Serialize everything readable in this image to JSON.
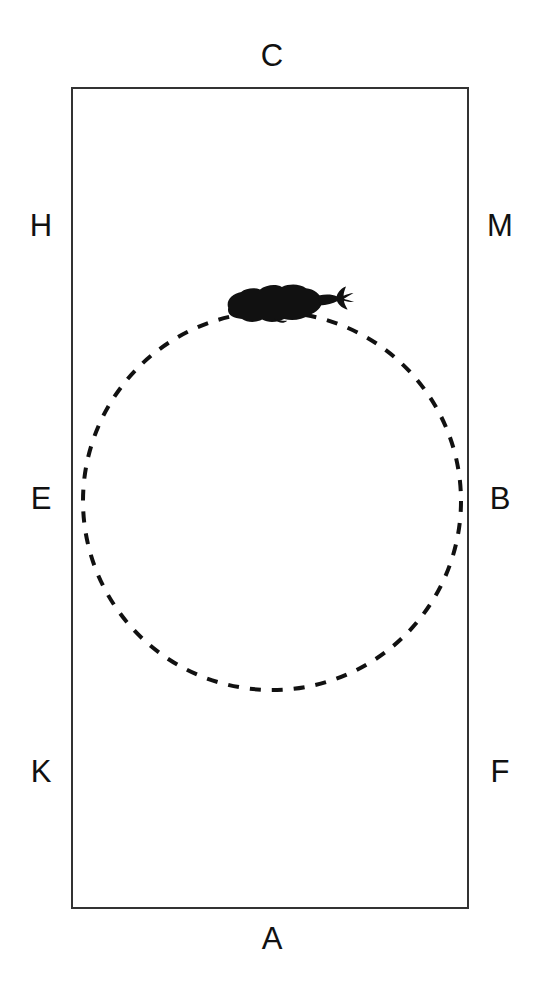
{
  "figure": {
    "title": "",
    "background_color": "#ffffff",
    "ink_color": "#111111"
  },
  "arena": {
    "name": "rectangular-arena",
    "shape": "rectangle",
    "stroke_color": "#333333",
    "stroke_width": 2,
    "x": 72,
    "y": 88,
    "width": 396,
    "height": 820
  },
  "path_circle": {
    "name": "dashed-circle-path",
    "shape": "circle",
    "stroke_color": "#111111",
    "stroke_width": 4,
    "dash": "11 11",
    "center_x": 272,
    "center_y": 501,
    "radius": 189
  },
  "animal": {
    "name": "fish-silhouette",
    "fill_color": "#111111",
    "heading": "right",
    "position_x": 283,
    "position_y": 303
  },
  "labels": [
    {
      "id": "C",
      "text": "C",
      "position": "top-center",
      "x": 272,
      "y": 58
    },
    {
      "id": "H",
      "text": "H",
      "position": "left-upper",
      "x": 41,
      "y": 228
    },
    {
      "id": "M",
      "text": "M",
      "position": "right-upper",
      "x": 500,
      "y": 228
    },
    {
      "id": "E",
      "text": "E",
      "position": "left-middle",
      "x": 41,
      "y": 501
    },
    {
      "id": "B",
      "text": "B",
      "position": "right-middle",
      "x": 500,
      "y": 501
    },
    {
      "id": "K",
      "text": "K",
      "position": "left-lower",
      "x": 41,
      "y": 774
    },
    {
      "id": "F",
      "text": "F",
      "position": "right-lower",
      "x": 500,
      "y": 774
    },
    {
      "id": "A",
      "text": "A",
      "position": "bottom-center",
      "x": 272,
      "y": 941
    }
  ]
}
